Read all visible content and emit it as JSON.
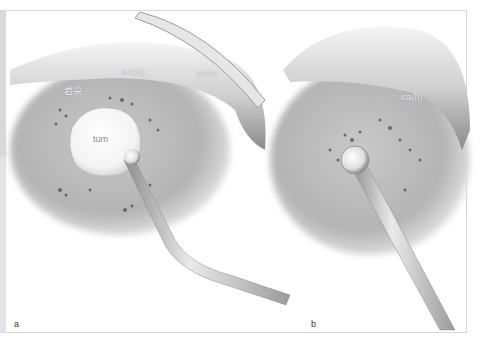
{
  "figure": {
    "panels": [
      {
        "letter": "a",
        "labels": {
          "ica": "ica(h)",
          "gspn": "gspn",
          "apex": "岩尖",
          "tum": "tum"
        }
      },
      {
        "letter": "b",
        "labels": {
          "ica": "ica(h)"
        }
      }
    ],
    "colors": {
      "background": "#ffffff",
      "frame": "#d6d6d6",
      "strip": "#d9d9d9"
    }
  }
}
